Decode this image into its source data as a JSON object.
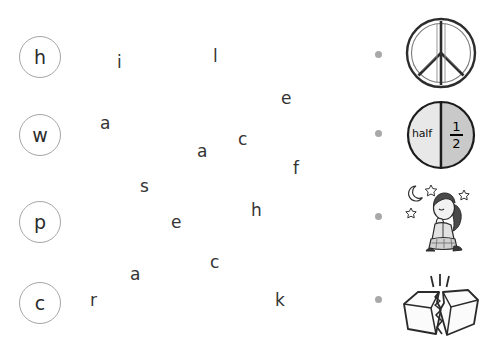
{
  "worksheet": {
    "type": "letter-to-picture-matching",
    "background_color": "#ffffff",
    "circle_border_color": "#a6a6a6",
    "text_color": "#343434",
    "bullet_color": "#a8a8a8"
  },
  "letter_circles": [
    {
      "label": "h",
      "x": 19,
      "y": 36
    },
    {
      "label": "w",
      "x": 19,
      "y": 114
    },
    {
      "label": "p",
      "x": 19,
      "y": 201
    },
    {
      "label": "c",
      "x": 19,
      "y": 282
    }
  ],
  "scattered_letters": [
    {
      "label": "i",
      "x": 117,
      "y": 54
    },
    {
      "label": "l",
      "x": 213,
      "y": 48
    },
    {
      "label": "e",
      "x": 281,
      "y": 90
    },
    {
      "label": "a",
      "x": 100,
      "y": 115
    },
    {
      "label": "c",
      "x": 238,
      "y": 131
    },
    {
      "label": "a",
      "x": 197,
      "y": 143
    },
    {
      "label": "f",
      "x": 293,
      "y": 160
    },
    {
      "label": "s",
      "x": 140,
      "y": 178
    },
    {
      "label": "h",
      "x": 251,
      "y": 202
    },
    {
      "label": "e",
      "x": 171,
      "y": 214
    },
    {
      "label": "c",
      "x": 210,
      "y": 254
    },
    {
      "label": "a",
      "x": 130,
      "y": 266
    },
    {
      "label": "r",
      "x": 90,
      "y": 292
    },
    {
      "label": "k",
      "x": 275,
      "y": 292
    }
  ],
  "bullets": [
    {
      "x": 375,
      "y": 51
    },
    {
      "x": 375,
      "y": 130
    },
    {
      "x": 375,
      "y": 213
    },
    {
      "x": 375,
      "y": 296
    }
  ],
  "pictures": [
    {
      "icon": "peace-symbol-icon",
      "alt": "peace symbol",
      "x": 404,
      "y": 14,
      "width": 74,
      "height": 78
    },
    {
      "icon": "half-circle-fraction-icon",
      "alt": "circle split into halves",
      "x": 404,
      "y": 100,
      "width": 74,
      "height": 70,
      "left_text": "half",
      "fraction_numerator": "1",
      "fraction_denominator": "2",
      "left_fill": "#e8e8e8",
      "right_fill": "#c9c9c9"
    },
    {
      "icon": "praying-girl-icon",
      "alt": "girl kneeling and praying under moon and stars",
      "x": 402,
      "y": 182,
      "width": 78,
      "height": 72
    },
    {
      "icon": "cracked-box-icon",
      "alt": "box breaking apart",
      "x": 398,
      "y": 272,
      "width": 84,
      "height": 70
    }
  ]
}
